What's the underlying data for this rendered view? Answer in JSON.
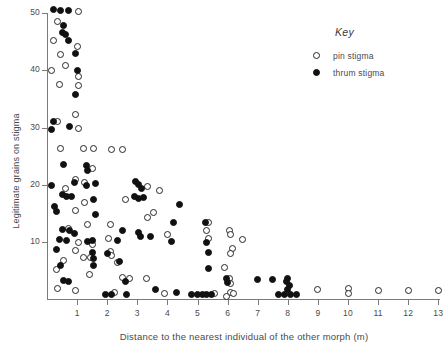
{
  "top_fragment": "",
  "legend": {
    "title": "Key",
    "entries": [
      {
        "marker": "open-circle",
        "label": "pin stigma"
      },
      {
        "marker": "filled-circle",
        "label": "thrum stigma"
      }
    ]
  },
  "chart_data": {
    "type": "scatter",
    "title": "",
    "xlabel": "Distance to the nearest individual of the other morph (m)",
    "ylabel": "Legitimate grains on stigma",
    "xlim": [
      0,
      13.4
    ],
    "ylim": [
      0,
      51.5
    ],
    "xticks": [
      1,
      2,
      3,
      4,
      5,
      6,
      7,
      8,
      9,
      10,
      11,
      12,
      13
    ],
    "yticks": [
      10,
      20,
      30,
      40,
      50
    ],
    "grid": false,
    "legend_position": "upper-right",
    "series": [
      {
        "name": "pin stigma",
        "marker": "open-circle",
        "color": "#262626",
        "points": [
          [
            1.05,
            50.3
          ],
          [
            0.35,
            48.6
          ],
          [
            0.2,
            45.2
          ],
          [
            1.0,
            44.2
          ],
          [
            0.45,
            42.8
          ],
          [
            0.6,
            40.8
          ],
          [
            0.15,
            40.0
          ],
          [
            1.05,
            39.0
          ],
          [
            0.4,
            37.5
          ],
          [
            1.05,
            37.4
          ],
          [
            0.95,
            32.3
          ],
          [
            0.35,
            31.0
          ],
          [
            1.05,
            29.8
          ],
          [
            0.45,
            26.4
          ],
          [
            1.2,
            26.3
          ],
          [
            1.55,
            26.3
          ],
          [
            2.15,
            26.2
          ],
          [
            2.5,
            26.2
          ],
          [
            1.5,
            22.8
          ],
          [
            0.95,
            20.9
          ],
          [
            1.25,
            20.3
          ],
          [
            0.6,
            19.4
          ],
          [
            3.35,
            19.6
          ],
          [
            3.75,
            18.9
          ],
          [
            2.6,
            17.4
          ],
          [
            1.25,
            16.8
          ],
          [
            0.95,
            15.5
          ],
          [
            3.55,
            15.2
          ],
          [
            3.35,
            14.3
          ],
          [
            1.35,
            13.0
          ],
          [
            2.1,
            13.1
          ],
          [
            5.35,
            13.4
          ],
          [
            0.7,
            12.4
          ],
          [
            5.3,
            12.0
          ],
          [
            6.05,
            12.0
          ],
          [
            6.1,
            11.2
          ],
          [
            4.0,
            11.3
          ],
          [
            5.35,
            10.6
          ],
          [
            2.05,
            10.5
          ],
          [
            6.5,
            10.4
          ],
          [
            1.05,
            9.9
          ],
          [
            1.5,
            9.5
          ],
          [
            0.95,
            8.5
          ],
          [
            2.1,
            8.3
          ],
          [
            2.15,
            7.6
          ],
          [
            6.15,
            8.9
          ],
          [
            6.1,
            7.9
          ],
          [
            1.2,
            7.3
          ],
          [
            1.45,
            7.2
          ],
          [
            0.55,
            6.7
          ],
          [
            2.35,
            6.4
          ],
          [
            5.9,
            5.5
          ],
          [
            0.3,
            5.2
          ],
          [
            1.4,
            4.3
          ],
          [
            2.5,
            3.7
          ],
          [
            2.75,
            3.6
          ],
          [
            3.3,
            3.5
          ],
          [
            6.05,
            3.6
          ],
          [
            6.1,
            2.7
          ],
          [
            0.35,
            1.9
          ],
          [
            0.95,
            1.5
          ],
          [
            2.25,
            1.1
          ],
          [
            6.1,
            1.1
          ],
          [
            6.2,
            1.0
          ],
          [
            5.55,
            0.9
          ],
          [
            9.0,
            1.6
          ],
          [
            10.0,
            1.9
          ],
          [
            10.0,
            1.0
          ],
          [
            11.0,
            1.5
          ],
          [
            12.0,
            1.5
          ],
          [
            13.0,
            1.5
          ],
          [
            3.9,
            0.9
          ],
          [
            5.95,
            0.5
          ]
        ]
      },
      {
        "name": "thrum stigma",
        "marker": "filled-circle",
        "color": "#111111",
        "points": [
          [
            0.2,
            50.6
          ],
          [
            0.45,
            50.5
          ],
          [
            0.7,
            50.5
          ],
          [
            0.55,
            47.8
          ],
          [
            0.5,
            46.6
          ],
          [
            0.6,
            46.2
          ],
          [
            0.7,
            45.3
          ],
          [
            0.95,
            43.0
          ],
          [
            1.0,
            40.0
          ],
          [
            0.95,
            35.8
          ],
          [
            0.2,
            31.0
          ],
          [
            0.15,
            29.7
          ],
          [
            0.75,
            30.2
          ],
          [
            0.55,
            23.5
          ],
          [
            1.3,
            23.4
          ],
          [
            1.35,
            22.4
          ],
          [
            0.9,
            20.4
          ],
          [
            0.15,
            19.9
          ],
          [
            1.3,
            19.9
          ],
          [
            1.6,
            20.2
          ],
          [
            2.95,
            20.5
          ],
          [
            3.05,
            20.1
          ],
          [
            3.15,
            19.4
          ],
          [
            0.5,
            18.2
          ],
          [
            0.65,
            18.0
          ],
          [
            0.8,
            17.9
          ],
          [
            1.55,
            17.4
          ],
          [
            2.9,
            17.9
          ],
          [
            3.05,
            17.6
          ],
          [
            3.2,
            17.8
          ],
          [
            4.4,
            16.5
          ],
          [
            0.25,
            16.1
          ],
          [
            0.3,
            15.3
          ],
          [
            1.6,
            14.8
          ],
          [
            4.2,
            13.4
          ],
          [
            5.25,
            13.3
          ],
          [
            0.5,
            12.1
          ],
          [
            0.75,
            12.0
          ],
          [
            0.9,
            11.5
          ],
          [
            2.5,
            11.9
          ],
          [
            3.05,
            11.7
          ],
          [
            3.1,
            11.0
          ],
          [
            3.45,
            10.9
          ],
          [
            0.4,
            10.4
          ],
          [
            0.65,
            10.2
          ],
          [
            1.35,
            10.0
          ],
          [
            1.5,
            10.3
          ],
          [
            2.35,
            10.3
          ],
          [
            4.15,
            10.0
          ],
          [
            5.3,
            9.9
          ],
          [
            0.3,
            8.6
          ],
          [
            1.5,
            8.2
          ],
          [
            2.0,
            8.0
          ],
          [
            5.35,
            8.1
          ],
          [
            1.55,
            7.0
          ],
          [
            2.4,
            6.6
          ],
          [
            0.45,
            5.9
          ],
          [
            1.55,
            5.8
          ],
          [
            5.35,
            5.4
          ],
          [
            0.55,
            3.3
          ],
          [
            0.7,
            3.1
          ],
          [
            2.6,
            3.0
          ],
          [
            5.95,
            3.6
          ],
          [
            6.0,
            2.8
          ],
          [
            7.0,
            3.4
          ],
          [
            7.5,
            3.4
          ],
          [
            8.0,
            3.6
          ],
          [
            7.95,
            3.0
          ],
          [
            8.05,
            2.3
          ],
          [
            8.0,
            1.6
          ],
          [
            3.6,
            1.6
          ],
          [
            4.3,
            1.1
          ],
          [
            1.95,
            0.8
          ],
          [
            2.15,
            0.8
          ],
          [
            2.65,
            0.8
          ],
          [
            4.8,
            0.7
          ],
          [
            5.0,
            0.7
          ],
          [
            5.15,
            0.7
          ],
          [
            5.3,
            0.7
          ],
          [
            5.45,
            0.7
          ],
          [
            7.7,
            0.7
          ],
          [
            7.9,
            0.7
          ],
          [
            8.1,
            0.7
          ],
          [
            8.3,
            0.7
          ]
        ]
      }
    ]
  }
}
